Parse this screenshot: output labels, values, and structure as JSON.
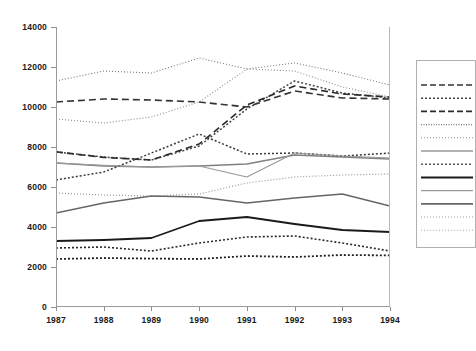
{
  "chart_data": {
    "type": "line",
    "title": "",
    "xlabel": "",
    "ylabel": "",
    "x": [
      1987,
      1988,
      1989,
      1990,
      1991,
      1992,
      1993,
      1994
    ],
    "categories": [
      "1987",
      "1988",
      "1989",
      "1990",
      "1991",
      "1992",
      "1993",
      "1994"
    ],
    "ylim": [
      0,
      14000
    ],
    "yticks": [
      0,
      2000,
      4000,
      6000,
      8000,
      10000,
      12000,
      14000
    ],
    "ytick_labels": [
      "0",
      "2000",
      "4000",
      "6000",
      "8000",
      "10000",
      "12000",
      "14000"
    ],
    "xtick_labels": [
      "1987",
      "1988",
      "1989",
      "1990",
      "1991",
      "1992",
      "1993",
      "1994"
    ],
    "grid": false,
    "legend_position": "right",
    "legend_labels_visible": false,
    "series": [
      {
        "name": "series-1",
        "style": "dashed-heavy",
        "color": "#333333",
        "width": 1.6,
        "dash": "7,4",
        "values": [
          10250,
          10400,
          10350,
          10250,
          10000,
          10800,
          10450,
          10400
        ]
      },
      {
        "name": "series-2",
        "style": "dotted-medium",
        "color": "#444444",
        "width": 1.5,
        "dash": "2,2",
        "values": [
          7750,
          7500,
          7350,
          8050,
          9900,
          11300,
          10700,
          10450
        ]
      },
      {
        "name": "series-3",
        "style": "dashed-heavy-2",
        "color": "#2b2b2b",
        "width": 1.6,
        "dash": "7,4",
        "values": [
          7760,
          7480,
          7350,
          8150,
          10100,
          11050,
          10650,
          10500
        ]
      },
      {
        "name": "series-4",
        "style": "dotted-fine",
        "color": "#777777",
        "width": 1.1,
        "dash": "1,2",
        "values": [
          11300,
          11800,
          11700,
          12450,
          11900,
          12200,
          11700,
          11100
        ]
      },
      {
        "name": "series-5",
        "style": "dotted-fine-2",
        "color": "#8a8a8a",
        "width": 1.1,
        "dash": "1,2",
        "values": [
          9400,
          9200,
          9500,
          10250,
          11900,
          11800,
          11000,
          10500
        ]
      },
      {
        "name": "series-6",
        "style": "solid-gray",
        "color": "#808080",
        "width": 1.4,
        "dash": "none",
        "values": [
          7200,
          7050,
          7000,
          7050,
          7150,
          7600,
          7500,
          7400
        ]
      },
      {
        "name": "series-7",
        "style": "dotted-dense",
        "color": "#3a3a3a",
        "width": 1.5,
        "dash": "2,2",
        "values": [
          6350,
          6750,
          7700,
          8650,
          7650,
          7700,
          7550,
          7700
        ]
      },
      {
        "name": "series-8",
        "style": "solid-black",
        "color": "#1a1a1a",
        "width": 1.8,
        "dash": "none",
        "values": [
          3300,
          3350,
          3450,
          4300,
          4500,
          4150,
          3850,
          3750
        ]
      },
      {
        "name": "series-9",
        "style": "solid-light",
        "color": "#9a9a9a",
        "width": 1.2,
        "dash": "none",
        "values": [
          7200,
          7080,
          7000,
          7050,
          6500,
          7700,
          7550,
          7450
        ]
      },
      {
        "name": "series-10",
        "style": "solid-mid",
        "color": "#666666",
        "width": 1.6,
        "dash": "none",
        "values": [
          4700,
          5200,
          5550,
          5500,
          5200,
          5450,
          5650,
          5050
        ]
      },
      {
        "name": "series-11",
        "style": "dotted-sparse",
        "color": "#999999",
        "width": 1.2,
        "dash": "1,2",
        "values": [
          5700,
          5600,
          5550,
          5650,
          6200,
          6500,
          6600,
          6650
        ]
      },
      {
        "name": "series-12",
        "style": "dotted-bold-low",
        "color": "#2b2b2b",
        "width": 1.6,
        "dash": "2,2",
        "values": [
          2950,
          3000,
          2800,
          3200,
          3500,
          3550,
          3200,
          2800
        ]
      },
      {
        "name": "series-13",
        "style": "dotted-bold-lowest",
        "color": "#222222",
        "width": 1.8,
        "dash": "2,2",
        "values": [
          2400,
          2450,
          2420,
          2400,
          2550,
          2500,
          2600,
          2580
        ]
      }
    ]
  },
  "legend": {
    "entries": [
      {
        "name": "legend-entry-1",
        "style": "dashed",
        "color": "#333333",
        "width": 1.6,
        "dash": "6,3"
      },
      {
        "name": "legend-entry-2",
        "style": "dotted-dense",
        "color": "#444444",
        "width": 1.5,
        "dash": "2,2"
      },
      {
        "name": "legend-entry-3",
        "style": "dashed",
        "color": "#2b2b2b",
        "width": 1.6,
        "dash": "6,3"
      },
      {
        "name": "legend-entry-4",
        "style": "dotted-fine",
        "color": "#777777",
        "width": 1.2,
        "dash": "1,1.5"
      },
      {
        "name": "legend-entry-5",
        "style": "dotted-fine",
        "color": "#8a8a8a",
        "width": 1.1,
        "dash": "1,2"
      },
      {
        "name": "legend-entry-6",
        "style": "solid",
        "color": "#9a9a9a",
        "width": 1.6,
        "dash": "none"
      },
      {
        "name": "legend-entry-7",
        "style": "dotted-dense",
        "color": "#555555",
        "width": 1.5,
        "dash": "2,2"
      },
      {
        "name": "legend-entry-8",
        "style": "solid",
        "color": "#1a1a1a",
        "width": 2.0,
        "dash": "none"
      },
      {
        "name": "legend-entry-9",
        "style": "solid",
        "color": "#9a9a9a",
        "width": 1.2,
        "dash": "none"
      },
      {
        "name": "legend-entry-10",
        "style": "solid",
        "color": "#666666",
        "width": 1.8,
        "dash": "none"
      },
      {
        "name": "legend-entry-11",
        "style": "dotted-sparse",
        "color": "#999999",
        "width": 1.2,
        "dash": "1,2"
      },
      {
        "name": "legend-entry-12",
        "style": "dotted-sparse",
        "color": "#aaaaaa",
        "width": 1.1,
        "dash": "1,2"
      }
    ]
  },
  "axis": {
    "y_axis_color": "#8d8d8d",
    "x_axis_color": "#8d8d8d",
    "tick_label_color": "#1a1a1a"
  }
}
